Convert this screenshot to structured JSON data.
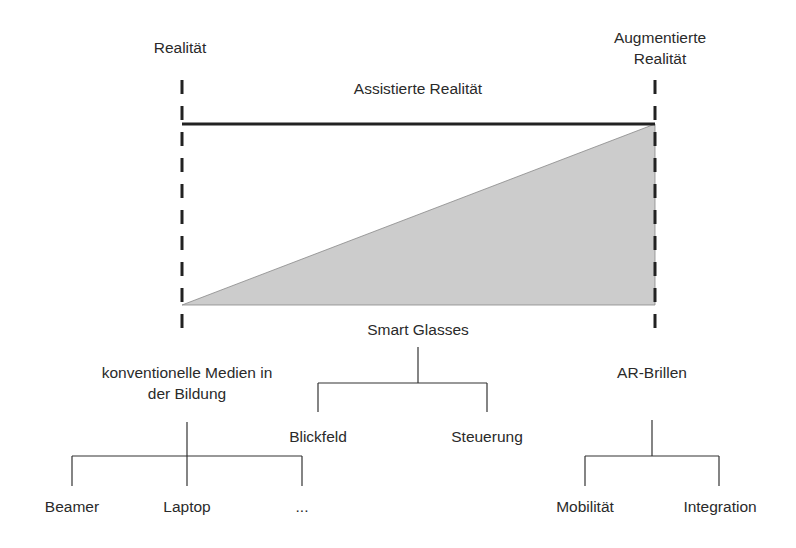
{
  "labels": {
    "left_end": "Realität",
    "right_end_line1": "Augmentierte",
    "right_end_line2": "Realität",
    "span": "Assistierte Realität",
    "mid_category": "Smart Glasses",
    "left_category_line1": "konventionelle Medien in",
    "left_category_line2": "der Bildung",
    "right_category": "AR-Brillen"
  },
  "tree": {
    "left_children": [
      "Beamer",
      "Laptop",
      "..."
    ],
    "mid_children": [
      "Blickfeld",
      "Steuerung"
    ],
    "right_children": [
      "Mobilität",
      "Integration"
    ]
  },
  "colors": {
    "line": "#222222",
    "fill": "#cccccc",
    "text": "#2a2a2a"
  }
}
